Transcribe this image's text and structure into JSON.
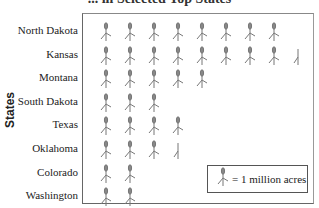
{
  "chart_data": {
    "type": "pictograph",
    "title": "... in Selected Top States",
    "ylabel": "States",
    "categories": [
      "North Dakota",
      "Kansas",
      "Montana",
      "South Dakota",
      "Texas",
      "Oklahoma",
      "Colorado",
      "Washington"
    ],
    "values": [
      8,
      8.5,
      5,
      3,
      4,
      3.5,
      2,
      2
    ],
    "unit": "million acres",
    "legend": {
      "icon": "wheat-icon",
      "text": "= 1 million acres",
      "value": 1
    }
  },
  "colors": {
    "icon": "#777777",
    "frame": "#666666",
    "text": "#222222"
  }
}
